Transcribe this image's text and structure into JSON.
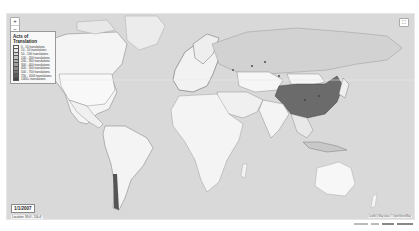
{
  "map": {
    "background_color": "#d9d9d9",
    "land_color": "#f4f4f4",
    "border_color": "#7a7a7a",
    "highlight_color": "#6b6b6b",
    "highlighted_country": "China"
  },
  "controls": {
    "zoom_in": "+",
    "zoom_out": "−",
    "fullscreen_icon": "⛶"
  },
  "legend": {
    "title": "Acts of Translation",
    "items": [
      {
        "label": "0 - 10 translations",
        "color": "#f7f7f7"
      },
      {
        "label": "10 - 50 translations",
        "color": "#e6e6e6"
      },
      {
        "label": "50 - 100 translations",
        "color": "#d4d4d4"
      },
      {
        "label": "100 - 200 translations",
        "color": "#c2c2c2"
      },
      {
        "label": "200 - 300 translations",
        "color": "#b0b0b0"
      },
      {
        "label": "300 - 400 translations",
        "color": "#9e9e9e"
      },
      {
        "label": "400 - 500 translations",
        "color": "#8a8a8a"
      },
      {
        "label": "500 - 750 translations",
        "color": "#767676"
      },
      {
        "label": "750 - 1000 translations",
        "color": "#5e5e5e"
      },
      {
        "label": "1000+ translations",
        "color": "#444444"
      }
    ]
  },
  "date_box": {
    "label": "1/1/2007"
  },
  "coords": {
    "label": "Location: 39.0°, 116.4°"
  },
  "timeline": {
    "play_buttons": [
      "⏮",
      "◀",
      "▶",
      "⏭"
    ],
    "speed_label": "10 fps"
  },
  "attribution": "Leaflet | Map data © OpenStreetMap"
}
